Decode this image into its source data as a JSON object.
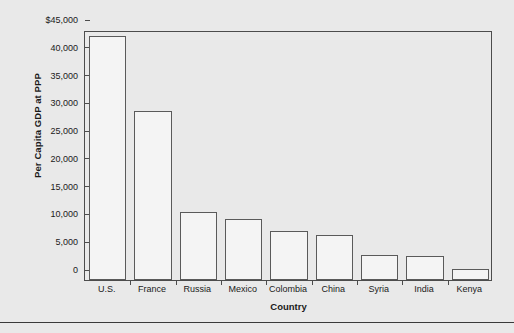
{
  "chart_data": {
    "type": "bar",
    "title": "",
    "subtitle": "",
    "xlabel": "Country",
    "ylabel": "Per Capita GDP at PPP",
    "categories": [
      "U.S.",
      "France",
      "Russia",
      "Mexico",
      "Colombia",
      "China",
      "Syria",
      "India",
      "Kenya"
    ],
    "values": [
      44000,
      30500,
      12200,
      11000,
      8800,
      8100,
      4500,
      4300,
      1900
    ],
    "ylim": [
      0,
      45000
    ],
    "ytick_values": [
      0,
      5000,
      10000,
      15000,
      20000,
      25000,
      30000,
      35000,
      40000,
      45000
    ],
    "ytick_labels": [
      "0",
      "5,000",
      "10,000",
      "15,000",
      "20,000",
      "25,000",
      "30,000",
      "35,000",
      "40,000",
      "$45,000"
    ],
    "grid": false,
    "legend": null,
    "legend_position": "none",
    "bar_fill_color": "#f4f4f4",
    "bar_edge_color": "#5a5a5a",
    "axis_color": "#4c4c4c",
    "background_color": "#e9e9e9",
    "text_color": "#1a1a1a"
  }
}
